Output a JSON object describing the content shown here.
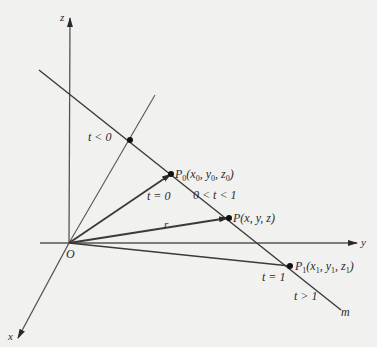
{
  "diagram": {
    "colors": {
      "background": "#f1f1f0",
      "line": "#3a3a3a",
      "text": "#2a2a2a"
    },
    "axes": {
      "z_label": "z",
      "y_label": "y",
      "x_label": "x",
      "origin_label": "O"
    },
    "line_label": "m",
    "vector_label": "r",
    "points": {
      "p0": {
        "name": "P",
        "sub": "0",
        "coords": "(x",
        "c1sub": "0",
        "c2": ", y",
        "c2sub": "0",
        "c3": ", z",
        "c3sub": "0",
        "close": ")"
      },
      "p": {
        "label": "P(x, y, z)"
      },
      "p1": {
        "name": "P",
        "sub": "1",
        "coords": "(x",
        "c1sub": "1",
        "c2": ", y",
        "c2sub": "1",
        "c3": ", z",
        "c3sub": "1",
        "close": ")"
      }
    },
    "parameter_labels": {
      "t_less_0": "t < 0",
      "t_eq_0": "t = 0",
      "t_between": "0 < t < 1",
      "t_eq_1": "t = 1",
      "t_greater_1": "t > 1"
    }
  }
}
